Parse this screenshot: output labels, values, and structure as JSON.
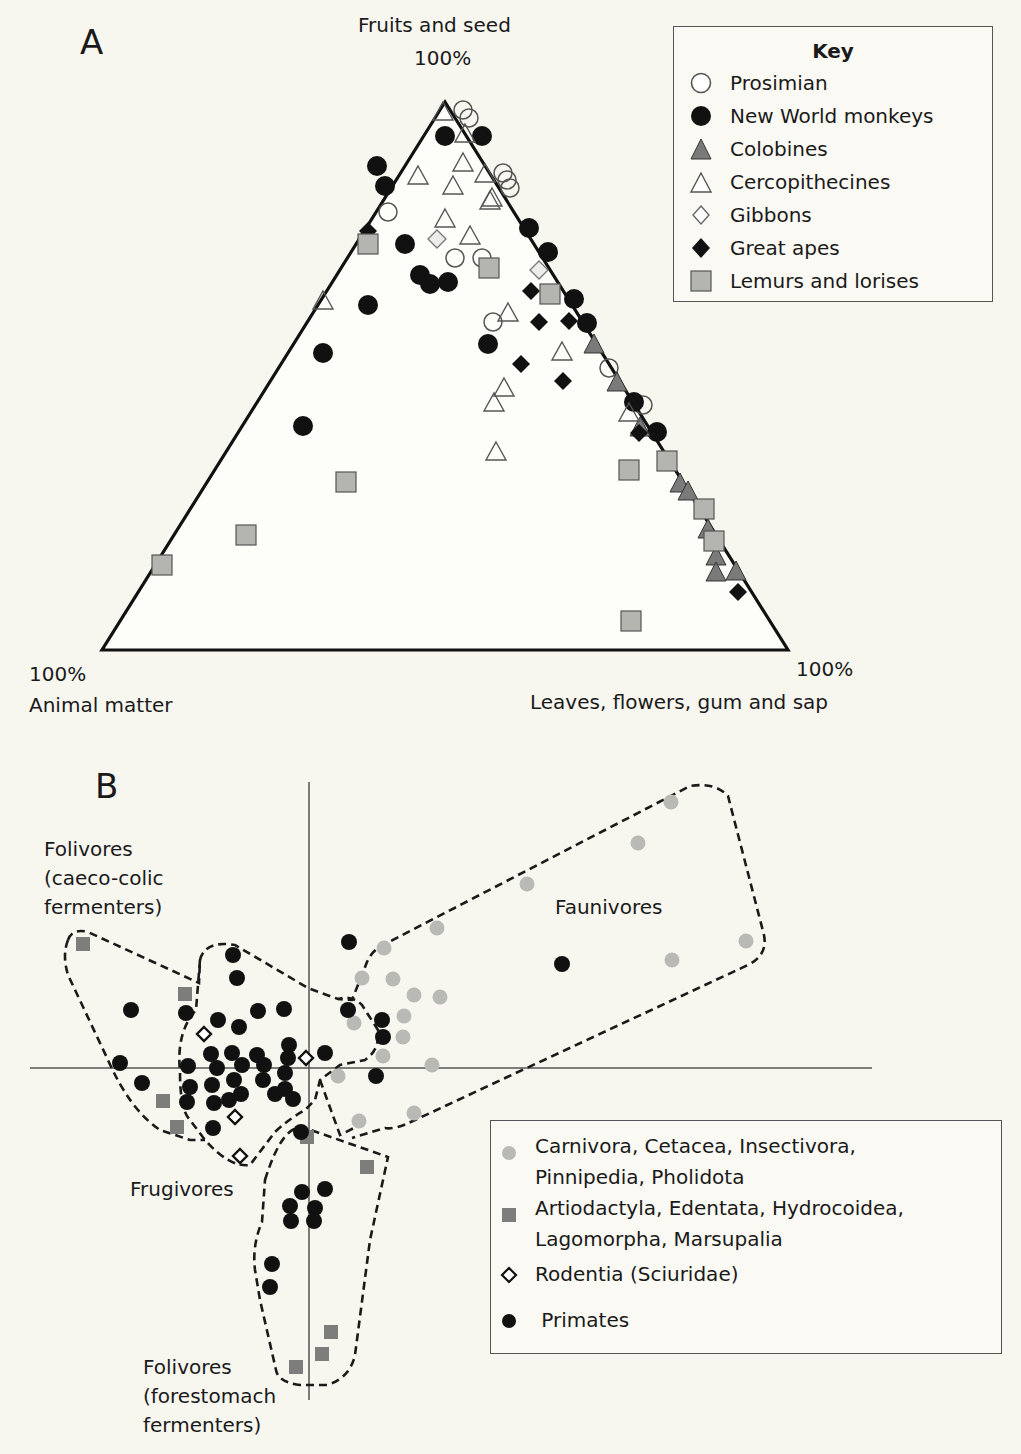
{
  "panel_a": {
    "letter": "A",
    "apex_top_label": "Fruits and seed",
    "apex_top_pct": "100%",
    "apex_left_pct": "100%",
    "apex_left_label": "Animal matter",
    "apex_right_pct": "100%",
    "apex_right_label": "Leaves, flowers, gum and sap",
    "key": {
      "title": "Key",
      "items": [
        {
          "label": "Prosimian",
          "marker": "circle-open"
        },
        {
          "label": "New World monkeys",
          "marker": "circle-filled"
        },
        {
          "label": "Colobines",
          "marker": "triangle-gray"
        },
        {
          "label": "Cercopithecines",
          "marker": "triangle-open"
        },
        {
          "label": "Gibbons",
          "marker": "diamond-open"
        },
        {
          "label": "Great apes",
          "marker": "diamond-filled"
        },
        {
          "label": "Lemurs and lorises",
          "marker": "square-gray"
        }
      ]
    }
  },
  "panel_b": {
    "letter": "B",
    "regions": {
      "folivores_caeco": "Folivores\n(caeco-colic\nfermenters)",
      "frugivores": "Frugivores",
      "faunivores": "Faunivores",
      "folivores_fore": "Folivores\n(forestomach\nfermenters)"
    },
    "key": {
      "items": [
        {
          "label": "Carnivora, Cetacea, Insectivora,\nPinnipedia, Pholidota",
          "marker": "dot-lightgray"
        },
        {
          "label": "Artiodactyla, Edentata, Hydrocoidea,\nLagomorpha, Marsupalia",
          "marker": "square-darkgray"
        },
        {
          "label": "Rodentia (Sciuridae)",
          "marker": "diamond-open-bold"
        },
        {
          "label": " Primates",
          "marker": "dot-black"
        }
      ]
    }
  },
  "colors": {
    "background": "#f7f6ef",
    "black": "#111111",
    "colobine_gray": "#7a7a7a",
    "lemur_gray": "#b4b4b0",
    "faunivore_gray": "#b9b9b6",
    "square_darkgray": "#7d7d7b",
    "gibbon_fill": "#ececea"
  },
  "chart_data": [
    {
      "type": "scatter",
      "subtype": "ternary",
      "title": "A",
      "axes": {
        "top": "Fruits and seed (100%)",
        "bottom_left": "Animal matter (100%)",
        "bottom_right": "Leaves, flowers, gum and sap (100%)"
      },
      "coordinate_note": "points given as [x, y] pixel positions inside a triangle with vertices top=(445,102), bottom-left=(102,650), bottom-right=(788,650)",
      "triangle": [
        [
          445,
          102
        ],
        [
          102,
          650
        ],
        [
          788,
          650
        ]
      ],
      "legend_position": "top-right",
      "series": [
        {
          "name": "Prosimian",
          "marker": "circle-open",
          "points": [
            [
              463,
              110
            ],
            [
              469,
              118
            ],
            [
              455,
              258
            ],
            [
              482,
              258
            ],
            [
              388,
              212
            ],
            [
              503,
              173
            ],
            [
              507,
              180
            ],
            [
              510,
              188
            ],
            [
              493,
              322
            ],
            [
              609,
              368
            ],
            [
              643,
              405
            ]
          ]
        },
        {
          "name": "New World monkeys",
          "marker": "circle-filled",
          "points": [
            [
              445,
              136
            ],
            [
              482,
              136
            ],
            [
              377,
              166
            ],
            [
              385,
              186
            ],
            [
              529,
              228
            ],
            [
              548,
              252
            ],
            [
              405,
              244
            ],
            [
              420,
              275
            ],
            [
              430,
              284
            ],
            [
              448,
              282
            ],
            [
              368,
              305
            ],
            [
              323,
              353
            ],
            [
              574,
              299
            ],
            [
              587,
              323
            ],
            [
              488,
              344
            ],
            [
              303,
              426
            ],
            [
              634,
              402
            ],
            [
              657,
              432
            ]
          ]
        },
        {
          "name": "Colobines",
          "marker": "triangle-gray",
          "points": [
            [
              594,
              345
            ],
            [
              617,
              383
            ],
            [
              640,
              428
            ],
            [
              680,
              484
            ],
            [
              688,
              492
            ],
            [
              708,
              530
            ],
            [
              716,
              557
            ],
            [
              716,
              573
            ],
            [
              736,
              572
            ]
          ]
        },
        {
          "name": "Cercopithecines",
          "marker": "triangle-open",
          "points": [
            [
              443,
              112
            ],
            [
              465,
              134
            ],
            [
              463,
              163
            ],
            [
              485,
              174
            ],
            [
              418,
              176
            ],
            [
              453,
              186
            ],
            [
              492,
              198
            ],
            [
              490,
              201
            ],
            [
              445,
              219
            ],
            [
              470,
              236
            ],
            [
              323,
              301
            ],
            [
              508,
              313
            ],
            [
              562,
              352
            ],
            [
              504,
              388
            ],
            [
              494,
              403
            ],
            [
              496,
              452
            ],
            [
              629,
              413
            ]
          ]
        },
        {
          "name": "Gibbons",
          "marker": "diamond-open",
          "points": [
            [
              437,
              239
            ],
            [
              539,
              270
            ]
          ]
        },
        {
          "name": "Great apes",
          "marker": "diamond-filled",
          "points": [
            [
              368,
              231
            ],
            [
              531,
              291
            ],
            [
              539,
              322
            ],
            [
              569,
              321
            ],
            [
              521,
              364
            ],
            [
              563,
              381
            ],
            [
              639,
              433
            ],
            [
              738,
              592
            ]
          ]
        },
        {
          "name": "Lemurs and lorises",
          "marker": "square-gray",
          "points": [
            [
              368,
              244
            ],
            [
              489,
              268
            ],
            [
              550,
              294
            ],
            [
              629,
              470
            ],
            [
              667,
              461
            ],
            [
              704,
              509
            ],
            [
              714,
              541
            ],
            [
              346,
              482
            ],
            [
              246,
              535
            ],
            [
              162,
              565
            ],
            [
              631,
              621
            ]
          ]
        }
      ]
    },
    {
      "type": "scatter",
      "title": "B",
      "xlabel": "",
      "ylabel": "",
      "axes_lines": {
        "horizontal_y": 1068,
        "horizontal_x": [
          30,
          872
        ],
        "vertical_x": 309,
        "vertical_y": [
          782,
          1400
        ]
      },
      "coordinate_note": "points given as [x, y] pixel positions; ordination plot without tick labels",
      "grid": false,
      "legend_position": "bottom-right",
      "groups": [
        "Folivores (caeco-colic fermenters)",
        "Frugivores",
        "Faunivores",
        "Folivores (forestomach fermenters)"
      ],
      "series": [
        {
          "name": "Carnivora, Cetacea, Insectivora, Pinnipedia, Pholidota",
          "marker": "dot-lightgray",
          "points": [
            [
              671,
              802
            ],
            [
              638,
              843
            ],
            [
              527,
              884
            ],
            [
              437,
              928
            ],
            [
              384,
              948
            ],
            [
              746,
              941
            ],
            [
              672,
              960
            ],
            [
              362,
              978
            ],
            [
              393,
              979
            ],
            [
              414,
              995
            ],
            [
              440,
              997
            ],
            [
              354,
              1023
            ],
            [
              404,
              1016
            ],
            [
              403,
              1037
            ],
            [
              383,
              1056
            ],
            [
              432,
              1065
            ],
            [
              338,
              1076
            ],
            [
              359,
              1121
            ],
            [
              414,
              1113
            ]
          ]
        },
        {
          "name": "Artiodactyla, Edentata, Hydrocoidea, Lagomorpha, Marsupalia",
          "marker": "square-darkgray",
          "points": [
            [
              83,
              944
            ],
            [
              185,
              994
            ],
            [
              163,
              1101
            ],
            [
              177,
              1127
            ],
            [
              307,
              1137
            ],
            [
              367,
              1167
            ],
            [
              331,
              1332
            ],
            [
              322,
              1354
            ],
            [
              296,
              1367
            ]
          ]
        },
        {
          "name": "Rodentia (Sciuridae)",
          "marker": "diamond-open-bold",
          "points": [
            [
              204,
              1034
            ],
            [
              306,
              1058
            ],
            [
              235,
              1117
            ],
            [
              240,
              1156
            ]
          ]
        },
        {
          "name": "Primates",
          "marker": "dot-black",
          "points": [
            [
              349,
              942
            ],
            [
              562,
              964
            ],
            [
              233,
              955
            ],
            [
              237,
              978
            ],
            [
              131,
              1010
            ],
            [
              186,
              1013
            ],
            [
              258,
              1011
            ],
            [
              284,
              1009
            ],
            [
              218,
              1020
            ],
            [
              239,
              1027
            ],
            [
              348,
              1010
            ],
            [
              289,
              1045
            ],
            [
              211,
              1054
            ],
            [
              232,
              1053
            ],
            [
              257,
              1055
            ],
            [
              288,
              1058
            ],
            [
              325,
              1053
            ],
            [
              382,
              1020
            ],
            [
              383,
              1037
            ],
            [
              120,
              1063
            ],
            [
              188,
              1066
            ],
            [
              217,
              1068
            ],
            [
              242,
              1065
            ],
            [
              264,
              1065
            ],
            [
              285,
              1073
            ],
            [
              142,
              1083
            ],
            [
              190,
              1087
            ],
            [
              212,
              1085
            ],
            [
              234,
              1080
            ],
            [
              263,
              1080
            ],
            [
              285,
              1089
            ],
            [
              376,
              1076
            ],
            [
              214,
              1103
            ],
            [
              241,
              1094
            ],
            [
              275,
              1094
            ],
            [
              293,
              1099
            ],
            [
              213,
              1128
            ],
            [
              229,
              1100
            ],
            [
              187,
              1102
            ],
            [
              301,
              1132
            ],
            [
              302,
              1192
            ],
            [
              325,
              1189
            ],
            [
              290,
              1206
            ],
            [
              315,
              1208
            ],
            [
              291,
              1221
            ],
            [
              314,
              1221
            ],
            [
              272,
              1264
            ],
            [
              270,
              1287
            ]
          ]
        }
      ],
      "hulls": [
        {
          "name": "Folivores (caeco-colic fermenters)",
          "path": "M 68 940 Q 72 928 88 932 L 199 983 L 200 960 Q 205 940 235 945 L 308 988 L 338 999 L 352 1000 L 367 962 Q 372 950 385 944 L 690 786 Q 715 782 728 796 L 764 935 Q 768 955 748 965 L 415 1120 Q 395 1130 385 1128 L 352 1138"
        },
        {
          "name": "hull-outer-left",
          "path": "M 68 940 Q 62 955 68 975 L 108 1060 Q 130 1110 160 1130 L 190 1140 L 205 1140"
        },
        {
          "name": "Frugivores",
          "path": "M 200 960 L 196 1010 Q 176 1032 180 1072 Q 180 1110 190 1120 L 205 1140 Q 230 1168 250 1165 L 275 1132 Q 290 1118 305 1110 L 315 1100 L 320 1080 L 340 1065 L 365 1060 Q 380 1050 378 1030 L 362 1005 Q 352 995 338 999"
        },
        {
          "name": "Folivores (forestomach fermenters)",
          "path": "M 265 1180 Q 283 1122 305 1128 L 388 1157 L 370 1240 L 355 1355 Q 350 1378 327 1385 L 300 1385 Q 278 1382 276 1370 L 260 1300 L 255 1270 Q 252 1245 262 1222 Z"
        },
        {
          "name": "hull-link",
          "path": "M 320 1080 L 340 1135 L 360 1125"
        }
      ]
    }
  ]
}
